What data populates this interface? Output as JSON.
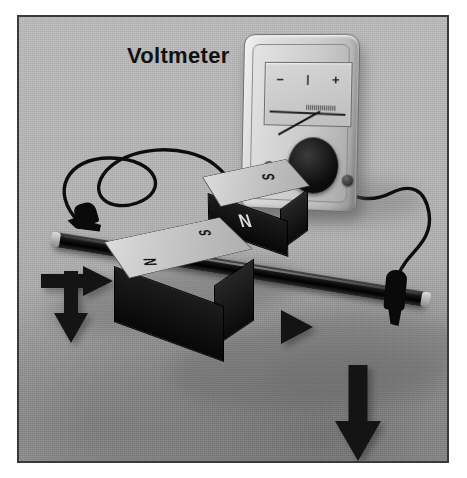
{
  "figure": {
    "title": "Voltmeter",
    "palette": {
      "background": "#b3b3b3",
      "border": "#3a3a3a",
      "magnet_top": "#c6c6c6",
      "magnet_dark": "#0b0b0b",
      "rail": "#101010",
      "arrow": "#141414",
      "text": "#111111"
    }
  },
  "label": {
    "voltmeter": "Voltmeter"
  },
  "meter": {
    "name": "voltmeter",
    "scale_marks": [
      "−",
      "|",
      "+"
    ],
    "minus": "−",
    "center": "|",
    "plus": "+",
    "needle_direction": "left-of-center",
    "knob": "selector-knob",
    "terminals": [
      "left-terminal",
      "right-terminal"
    ]
  },
  "rail": {
    "name": "conducting-rail",
    "description": "dark metal rod"
  },
  "magnets": [
    {
      "id": "magnet-rear",
      "top_pole": "S",
      "face_pole": "N"
    },
    {
      "id": "magnet-front",
      "top_pole": "S",
      "face_pole": "N"
    }
  ],
  "clips": [
    {
      "id": "clip-left",
      "label": "alligator-clip"
    },
    {
      "id": "clip-right",
      "label": "alligator-clip"
    }
  ],
  "wires": [
    {
      "id": "wire-left",
      "label": "lead-wire"
    },
    {
      "id": "wire-right",
      "label": "lead-wire"
    }
  ],
  "arrows": [
    {
      "id": "arrow-left-down",
      "direction": "down",
      "meaning": "motion"
    },
    {
      "id": "arrow-left-right",
      "direction": "right",
      "meaning": "motion"
    },
    {
      "id": "arrow-mid-right",
      "direction": "right",
      "meaning": "motion"
    },
    {
      "id": "arrow-bottom-down",
      "direction": "down",
      "meaning": "motion"
    }
  ]
}
